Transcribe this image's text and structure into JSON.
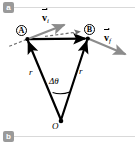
{
  "figure": {
    "panels": [
      {
        "tag": "a",
        "position": "top-left"
      },
      {
        "tag": "b",
        "position": "bottom-left"
      }
    ],
    "nodes": {
      "A": "A",
      "B": "B",
      "O": "O"
    },
    "labels": {
      "v_initial": "v",
      "v_initial_sub": "i",
      "v_final": "v",
      "v_final_sub": "f",
      "radius_left": "r",
      "radius_right": "r",
      "delta_theta": "Δθ"
    },
    "colors": {
      "stroke": "#000000",
      "accent_gray": "#8c8c8c",
      "tag_background": "#9a9a9a",
      "rule": "#d9d9d9",
      "background": "#ffffff"
    },
    "geometry": {
      "point_A": [
        27,
        39
      ],
      "point_B": [
        88,
        38
      ],
      "point_O": [
        61,
        122
      ],
      "chord_arrow_tip": [
        88,
        38
      ],
      "v_initial_arrow_tip": [
        68,
        23
      ],
      "v_final_arrow_tip": [
        129,
        56
      ],
      "dashed_tangent_tip": [
        84,
        32
      ],
      "dashed_back_tail": [
        8,
        47
      ]
    }
  }
}
